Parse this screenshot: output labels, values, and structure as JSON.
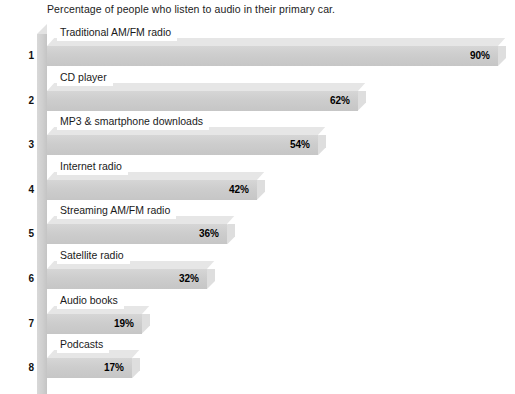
{
  "chart_data": {
    "type": "bar",
    "orientation": "horizontal",
    "title": "Percentage of people who listen to audio in their primary car.",
    "xlabel": "",
    "ylabel": "",
    "xlim": [
      0,
      100
    ],
    "grid": false,
    "legend": null,
    "value_suffix": "%",
    "categories": [
      "Traditional AM/FM radio",
      "CD player",
      "MP3 & smartphone downloads",
      "Internet radio",
      "Streaming AM/FM radio",
      "Satellite radio",
      "Audio books",
      "Podcasts"
    ],
    "values": [
      90,
      62,
      54,
      42,
      36,
      32,
      19,
      17
    ],
    "value_labels": [
      "90%",
      "62%",
      "54%",
      "42%",
      "36%",
      "32%",
      "19%",
      "17%"
    ],
    "index_labels": [
      "1",
      "2",
      "3",
      "4",
      "5",
      "6",
      "7",
      "8"
    ],
    "colors": {
      "bar_face": "#cdcdcd",
      "bar_top": "#e6e6e6",
      "bar_cap": "#dedede",
      "axis_wall": "#cfcfcf",
      "background": "#ffffff",
      "text": "#1a1a1a"
    }
  },
  "bars": [
    {
      "index": "1",
      "label": "Traditional AM/FM radio",
      "value": "90%"
    },
    {
      "index": "2",
      "label": "CD player",
      "value": "62%"
    },
    {
      "index": "3",
      "label": "MP3 & smartphone downloads",
      "value": "54%"
    },
    {
      "index": "4",
      "label": "Internet radio",
      "value": "42%"
    },
    {
      "index": "5",
      "label": "Streaming AM/FM radio",
      "value": "36%"
    },
    {
      "index": "6",
      "label": "Satellite radio",
      "value": "32%"
    },
    {
      "index": "7",
      "label": "Audio books",
      "value": "19%"
    },
    {
      "index": "8",
      "label": "Podcasts",
      "value": "17%"
    }
  ]
}
